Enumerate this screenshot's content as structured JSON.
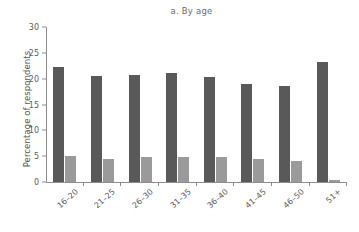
{
  "chart_data": {
    "type": "bar",
    "title": "a. By age",
    "xlabel": "",
    "ylabel": "Percentage of respondents",
    "categories": [
      "16–20",
      "21–25",
      "26–30",
      "31–35",
      "36–40",
      "41–45",
      "46–50",
      "51+"
    ],
    "series": [
      {
        "name": "series-1",
        "color": "#595959",
        "values": [
          22.2,
          20.6,
          20.8,
          21.1,
          20.3,
          19.0,
          18.6,
          23.2
        ]
      },
      {
        "name": "series-2",
        "color": "#9a9a9a",
        "values": [
          5.1,
          4.5,
          4.9,
          4.8,
          4.9,
          4.5,
          4.0,
          0.3
        ]
      }
    ],
    "ylim": [
      0,
      30
    ],
    "yticks": [
      0,
      5,
      10,
      15,
      20,
      25,
      30
    ],
    "ytick_labels": [
      "0",
      "5",
      "10",
      "15",
      "20",
      "25",
      "30"
    ],
    "grid": false,
    "legend": "none"
  },
  "colors": {
    "dark_bar": "#595959",
    "light_bar": "#9a9a9a",
    "axis": "#8d8d8d",
    "text": "#5a5a5a",
    "background": "#ffffff"
  }
}
